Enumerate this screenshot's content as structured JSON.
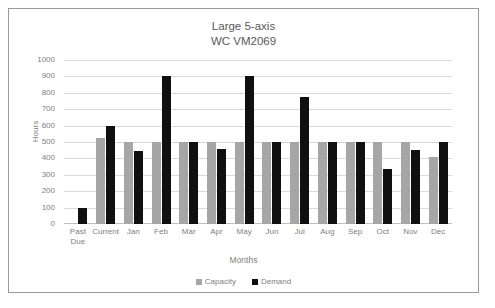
{
  "chart_data": {
    "type": "bar",
    "title": "Large 5-axis",
    "subtitle": "WC VM2069",
    "xlabel": "Months",
    "ylabel": "Hours",
    "ylim": [
      0,
      1000
    ],
    "ytick_step": 100,
    "yticks": [
      "1000",
      "900",
      "800",
      "700",
      "600",
      "500",
      "400",
      "300",
      "200",
      "100",
      "0"
    ],
    "grid": true,
    "legend_position": "bottom",
    "categories": [
      "Past Due",
      "Current",
      "Jan",
      "Feb",
      "Mar",
      "Apr",
      "May",
      "Jun",
      "Jul",
      "Aug",
      "Sep",
      "Oct",
      "Nov",
      "Dec"
    ],
    "category_lines": [
      [
        "Past",
        "Due"
      ],
      [
        "Current",
        ""
      ],
      [
        "Jan",
        ""
      ],
      [
        "Feb",
        ""
      ],
      [
        "Mar",
        ""
      ],
      [
        "Apr",
        ""
      ],
      [
        "May",
        ""
      ],
      [
        "Jun",
        ""
      ],
      [
        "Jul",
        ""
      ],
      [
        "Aug",
        ""
      ],
      [
        "Sep",
        ""
      ],
      [
        "Oct",
        ""
      ],
      [
        "Nov",
        ""
      ],
      [
        "Dec",
        ""
      ]
    ],
    "series": [
      {
        "name": "Capacity",
        "color": "#a6a6a6",
        "values": [
          0,
          525,
          500,
          500,
          500,
          500,
          500,
          500,
          500,
          500,
          500,
          500,
          500,
          410
        ]
      },
      {
        "name": "Demand",
        "color": "#101010",
        "values": [
          100,
          600,
          445,
          900,
          500,
          458,
          900,
          500,
          775,
          500,
          500,
          337,
          450,
          500
        ]
      }
    ]
  },
  "legend": {
    "items": [
      {
        "label": "Capacity",
        "color": "#a6a6a6"
      },
      {
        "label": "Demand",
        "color": "#101010"
      }
    ]
  }
}
